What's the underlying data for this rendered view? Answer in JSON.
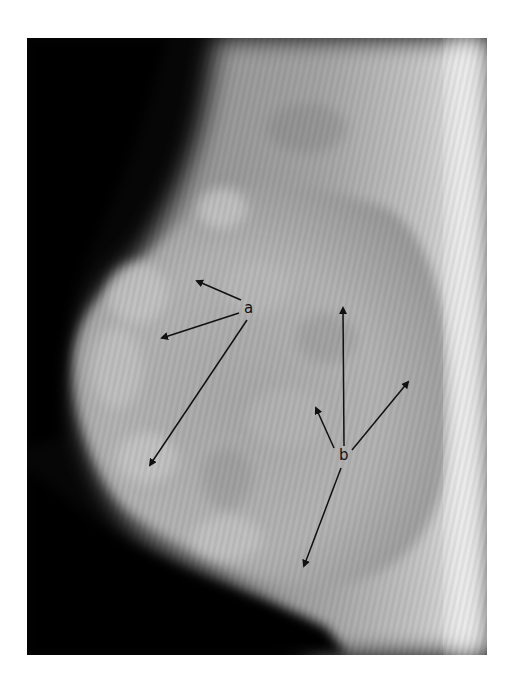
{
  "figure": {
    "type": "mammogram",
    "view": "lateral radiograph",
    "colors": {
      "background_air": "#050505",
      "tissue_gray": "#9a9a9a",
      "dense_tissue": "#c8c8c8",
      "skin_edge_white": "#f2f2f2",
      "arrow": "#111111"
    }
  },
  "annotations": {
    "a": {
      "label": "a",
      "position": [
        249,
        310
      ],
      "arrows": [
        {
          "to": [
            197,
            281
          ]
        },
        {
          "to": [
            162,
            338
          ]
        },
        {
          "to": [
            150,
            465
          ]
        }
      ]
    },
    "b": {
      "label": "b",
      "position": [
        344,
        456
      ],
      "arrows": [
        {
          "to": [
            343,
            308
          ]
        },
        {
          "to": [
            316,
            408
          ]
        },
        {
          "to": [
            408,
            382
          ]
        },
        {
          "to": [
            304,
            566
          ]
        }
      ]
    }
  }
}
